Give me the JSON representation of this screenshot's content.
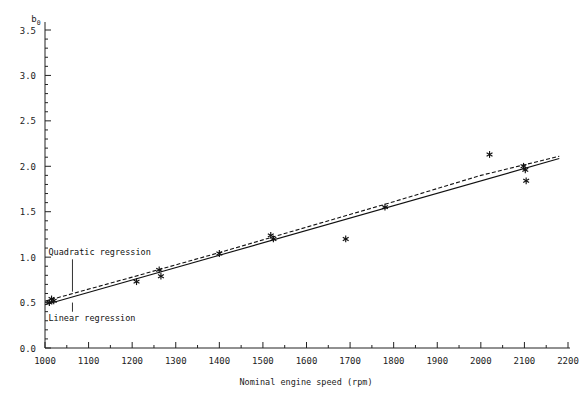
{
  "chart_data": {
    "type": "scatter",
    "title": "",
    "xlabel": "Nominal engine speed (rpm)",
    "ylabel": "b",
    "ylabel_subscript": "0",
    "xlim": [
      1000,
      2200
    ],
    "ylim": [
      0.0,
      3.5
    ],
    "xticks": [
      1000,
      1100,
      1200,
      1300,
      1400,
      1500,
      1600,
      1700,
      1800,
      1900,
      2000,
      2100,
      2200
    ],
    "xtick_labels": [
      "1000",
      "1100",
      "1200",
      "1300",
      "1400",
      "1500",
      "1600",
      "1700",
      "1800",
      "1900",
      "2000",
      "2100",
      "2200"
    ],
    "yticks": [
      0.0,
      0.5,
      1.0,
      1.5,
      2.0,
      2.5,
      3.0,
      3.5
    ],
    "ytick_labels": [
      "0.0",
      "0.5",
      "1.0",
      "1.5",
      "2.0",
      "2.5",
      "3.0",
      "3.5"
    ],
    "y_minor_step": 0.1,
    "grid": false,
    "legend": "none",
    "marker": "asterisk",
    "points": [
      {
        "x": 1010,
        "y": 0.5
      },
      {
        "x": 1015,
        "y": 0.54
      },
      {
        "x": 1020,
        "y": 0.52
      },
      {
        "x": 1210,
        "y": 0.73
      },
      {
        "x": 1262,
        "y": 0.86
      },
      {
        "x": 1266,
        "y": 0.79
      },
      {
        "x": 1400,
        "y": 1.04
      },
      {
        "x": 1518,
        "y": 1.24
      },
      {
        "x": 1524,
        "y": 1.2
      },
      {
        "x": 1690,
        "y": 1.2
      },
      {
        "x": 1780,
        "y": 1.55
      },
      {
        "x": 2020,
        "y": 2.13
      },
      {
        "x": 2098,
        "y": 2.0
      },
      {
        "x": 2102,
        "y": 1.96
      },
      {
        "x": 2104,
        "y": 1.84
      }
    ],
    "series": [
      {
        "name": "Linear regression",
        "style": "solid",
        "x": [
          1000,
          2180
        ],
        "y": [
          0.475,
          2.085
        ]
      },
      {
        "name": "Quadratic regression",
        "style": "dashed",
        "x": [
          1000,
          1200,
          1400,
          1600,
          1800,
          2000,
          2180
        ],
        "y": [
          0.515,
          0.78,
          1.05,
          1.33,
          1.61,
          1.9,
          2.11
        ]
      }
    ],
    "annotations": [
      {
        "text": "Quadratic regression",
        "x": 1063,
        "y": 1.02,
        "pointer": "down",
        "pointer_to_y": 0.62
      },
      {
        "text": "Linear regression",
        "x": 1063,
        "y": 0.3,
        "pointer": "up",
        "pointer_to_y": 0.5
      }
    ]
  }
}
